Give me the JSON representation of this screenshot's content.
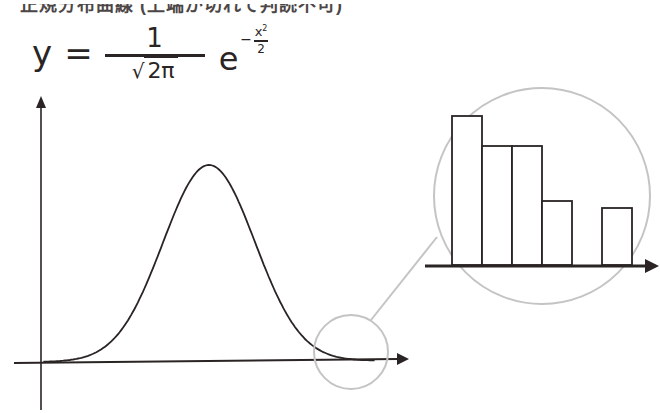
{
  "caption_partial": "正規分布曲線 (上端が切れて判読不可)",
  "formula": {
    "lhs": "y",
    "equals": "=",
    "numerator": "1",
    "sqrt_symbol": "√",
    "denominator": "2π",
    "base": "e",
    "exp_sign": "−",
    "exp_numerator": "x",
    "exp_power": "2",
    "exp_denominator": "2"
  },
  "colors": {
    "ink": "#2a2424",
    "magnifier": "#c4c4c4",
    "background": "#ffffff"
  },
  "chart_data": [
    {
      "type": "line",
      "title": "Normal distribution curve y = (1/√(2π)) e^(−x²/2)",
      "xlabel": "",
      "ylabel": "",
      "grid": false,
      "legend": null,
      "description": "Bell-shaped curve with unlabeled axes; a small circle highlights the right tail near the x-axis",
      "x": [
        -3.5,
        -3,
        -2,
        -1,
        0,
        1,
        2,
        3,
        3.5
      ],
      "values": [
        0.0009,
        0.0044,
        0.054,
        0.242,
        0.399,
        0.242,
        0.054,
        0.0044,
        0.0009
      ],
      "xlim": [
        -3.5,
        3.5
      ],
      "annotations": [
        "Magnifier circle on right tail"
      ]
    },
    {
      "type": "bar",
      "title": "Magnified view of right tail (discrete histogram)",
      "xlabel": "",
      "ylabel": "",
      "grid": false,
      "categories": [
        "1",
        "2",
        "3",
        "4",
        "5",
        "6"
      ],
      "values": [
        149,
        119,
        119,
        64,
        0,
        57
      ],
      "description": "Relative bar heights in pixels; 5th slot is empty"
    }
  ]
}
